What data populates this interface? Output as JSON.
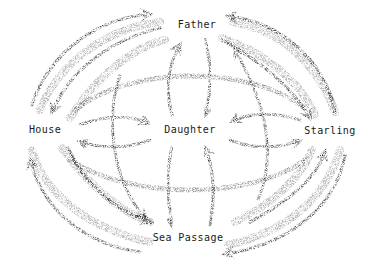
{
  "diagram": {
    "type": "network",
    "style": "stippled curved arrows with solid arrowheads",
    "nodes": [
      {
        "id": "father",
        "label": "Father",
        "x": 197,
        "y": 25
      },
      {
        "id": "house",
        "label": "House",
        "x": 45,
        "y": 130
      },
      {
        "id": "daughter",
        "label": "Daughter",
        "x": 190,
        "y": 130
      },
      {
        "id": "starling",
        "label": "Starling",
        "x": 330,
        "y": 131
      },
      {
        "id": "sea_passage",
        "label": "Sea Passage",
        "x": 188,
        "y": 238
      }
    ],
    "edges": [
      {
        "from": "house",
        "to": "father",
        "label": ""
      },
      {
        "from": "father",
        "to": "house",
        "label": ""
      },
      {
        "from": "starling",
        "to": "father",
        "label": ""
      },
      {
        "from": "father",
        "to": "starling",
        "label": ""
      },
      {
        "from": "house",
        "to": "sea_passage",
        "label": ""
      },
      {
        "from": "sea_passage",
        "to": "house",
        "label": ""
      },
      {
        "from": "starling",
        "to": "sea_passage",
        "label": ""
      },
      {
        "from": "sea_passage",
        "to": "starling",
        "label": ""
      },
      {
        "from": "house",
        "to": "daughter",
        "label": ""
      },
      {
        "from": "daughter",
        "to": "house",
        "label": ""
      },
      {
        "from": "starling",
        "to": "daughter",
        "label": ""
      },
      {
        "from": "daughter",
        "to": "starling",
        "label": ""
      },
      {
        "from": "father",
        "to": "daughter",
        "label": ""
      },
      {
        "from": "daughter",
        "to": "father",
        "label": ""
      },
      {
        "from": "sea_passage",
        "to": "daughter",
        "label": ""
      },
      {
        "from": "daughter",
        "to": "sea_passage",
        "label": ""
      },
      {
        "from": "starling",
        "to": "house",
        "label": ""
      },
      {
        "from": "house",
        "to": "starling",
        "label": ""
      }
    ],
    "colors": {
      "ink": "#1a1a1a",
      "stipple": "#555555",
      "background": "#ffffff"
    }
  }
}
